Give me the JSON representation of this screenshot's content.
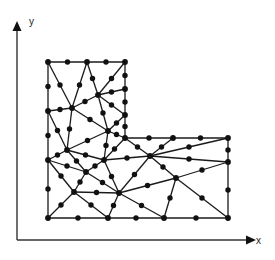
{
  "diagram": {
    "title": "",
    "axes": {
      "x_label": "x",
      "y_label": "y",
      "origin": [
        17,
        240
      ],
      "x_end": [
        255,
        240
      ],
      "y_end": [
        17,
        22
      ]
    },
    "colors": {
      "line": "#1a1a1a",
      "node": "#111111",
      "background": "#ffffff"
    },
    "vertices": {
      "A": [
        48,
        62
      ],
      "B": [
        87,
        62
      ],
      "C": [
        125,
        62
      ],
      "D": [
        48,
        111
      ],
      "E": [
        48,
        160
      ],
      "F": [
        48,
        218
      ],
      "G": [
        72,
        108
      ],
      "H": [
        98,
        95
      ],
      "I": [
        125,
        89
      ],
      "J": [
        125,
        115
      ],
      "K": [
        108,
        131
      ],
      "L": [
        67,
        150
      ],
      "M": [
        86,
        172
      ],
      "N": [
        104,
        160
      ],
      "O": [
        125,
        138
      ],
      "P": [
        173,
        138
      ],
      "Q": [
        228,
        138
      ],
      "R": [
        150,
        156
      ],
      "S": [
        228,
        162
      ],
      "T": [
        176,
        178
      ],
      "U": [
        119,
        193
      ],
      "V": [
        74,
        192
      ],
      "W": [
        108,
        218
      ],
      "X": [
        164,
        218
      ],
      "Y": [
        228,
        218
      ]
    },
    "triangles": [
      [
        "A",
        "B",
        "G"
      ],
      [
        "A",
        "G",
        "D"
      ],
      [
        "B",
        "H",
        "G"
      ],
      [
        "B",
        "C",
        "H"
      ],
      [
        "C",
        "I",
        "H"
      ],
      [
        "D",
        "G",
        "L"
      ],
      [
        "G",
        "H",
        "K"
      ],
      [
        "G",
        "K",
        "L"
      ],
      [
        "H",
        "I",
        "J"
      ],
      [
        "H",
        "J",
        "K"
      ],
      [
        "D",
        "L",
        "E"
      ],
      [
        "J",
        "O",
        "K"
      ],
      [
        "K",
        "O",
        "N"
      ],
      [
        "K",
        "N",
        "L"
      ],
      [
        "L",
        "N",
        "M"
      ],
      [
        "E",
        "L",
        "M"
      ],
      [
        "O",
        "P",
        "R"
      ],
      [
        "O",
        "R",
        "N"
      ],
      [
        "P",
        "Q",
        "R"
      ],
      [
        "Q",
        "S",
        "R"
      ],
      [
        "N",
        "R",
        "U"
      ],
      [
        "N",
        "U",
        "M"
      ],
      [
        "R",
        "S",
        "T"
      ],
      [
        "R",
        "T",
        "U"
      ],
      [
        "E",
        "M",
        "V"
      ],
      [
        "M",
        "U",
        "V"
      ],
      [
        "E",
        "V",
        "F"
      ],
      [
        "F",
        "V",
        "W"
      ],
      [
        "V",
        "U",
        "W"
      ],
      [
        "U",
        "T",
        "X"
      ],
      [
        "U",
        "X",
        "W"
      ],
      [
        "T",
        "S",
        "Y"
      ],
      [
        "T",
        "Y",
        "X"
      ]
    ]
  }
}
